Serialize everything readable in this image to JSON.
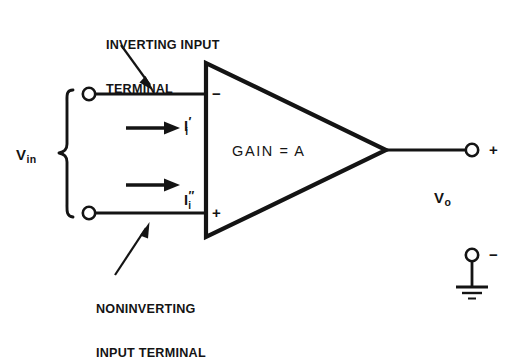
{
  "diagram": {
    "stroke_color": "#141414",
    "background_color": "#ffffff",
    "labels": {
      "inverting_line1": "INVERTING INPUT",
      "inverting_line2": "TERMINAL",
      "noninverting_line1": "NONINVERTING",
      "noninverting_line2": "INPUT TERMINAL",
      "gain": "GAIN = A",
      "v_in_symbol": "V",
      "v_in_subscript": "in",
      "v_out_symbol": "V",
      "v_out_subscript": "o",
      "current_1_symbol": "I",
      "current_1_prime": "′",
      "current_1_subscript": "i",
      "current_2_symbol": "I",
      "current_2_prime": "″",
      "current_2_subscript": "i",
      "inverting_sign": "−",
      "noninverting_sign": "+",
      "output_positive_sign": "+",
      "output_negative_sign": "−"
    },
    "components": {
      "amplifier_shape": "triangle",
      "input_terminal_top": "open-circle-terminal",
      "input_terminal_bottom": "open-circle-terminal",
      "output_terminal_positive": "open-circle-terminal",
      "output_terminal_negative": "open-circle-terminal",
      "ground": "ground-symbol",
      "input_bracket": "curly-brace",
      "current_arrow_top": "right-arrow",
      "current_arrow_bottom": "right-arrow",
      "pointer_inverting": "callout-arrow",
      "pointer_noninverting": "callout-arrow"
    }
  }
}
